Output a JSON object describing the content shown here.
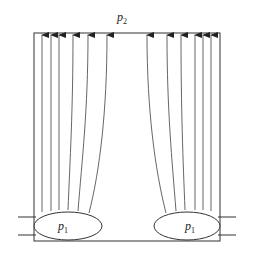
{
  "diagram": {
    "top_label": {
      "base": "p",
      "sub": "2"
    },
    "left_source_label": {
      "base": "p",
      "sub": "1"
    },
    "right_source_label": {
      "base": "p",
      "sub": "1"
    },
    "left_flow_lines": 6,
    "right_flow_lines": 6,
    "colors": {
      "stroke": "#333333",
      "flow": "#555555",
      "background": "#ffffff"
    }
  }
}
